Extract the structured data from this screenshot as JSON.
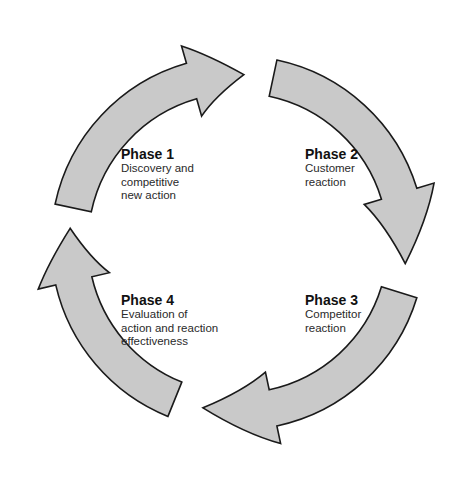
{
  "diagram": {
    "type": "cycle",
    "arrow_fill": "#c9c9c9",
    "arrow_stroke": "#1a1a1a",
    "direction": "clockwise",
    "phases": [
      {
        "title": "Phase 1",
        "description": "Discovery and\ncompetitive\nnew action"
      },
      {
        "title": "Phase 2",
        "description": "Customer\nreaction"
      },
      {
        "title": "Phase 3",
        "description": "Competitor\nreaction"
      },
      {
        "title": "Phase 4",
        "description": "Evaluation of\naction and reaction\neffectiveness"
      }
    ]
  }
}
